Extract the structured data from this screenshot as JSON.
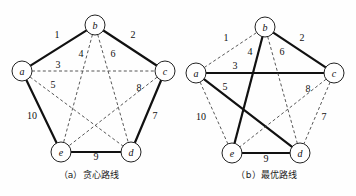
{
  "figure": {
    "panels": [
      {
        "id": "a",
        "caption": "（a）贪心路线",
        "nodes": [
          {
            "id": "a",
            "label": "a",
            "x": 22,
            "y": 71
          },
          {
            "id": "b",
            "label": "b",
            "x": 95,
            "y": 25
          },
          {
            "id": "c",
            "label": "c",
            "x": 165,
            "y": 71
          },
          {
            "id": "d",
            "label": "d",
            "x": 131,
            "y": 152
          },
          {
            "id": "e",
            "label": "e",
            "x": 61,
            "y": 152
          }
        ],
        "edges": [
          {
            "from": "a",
            "to": "b",
            "weight": "1",
            "style": "solid",
            "lx": 57,
            "ly": 38
          },
          {
            "from": "b",
            "to": "c",
            "weight": "2",
            "style": "solid",
            "lx": 133,
            "ly": 38
          },
          {
            "from": "a",
            "to": "c",
            "weight": "3",
            "style": "dashed",
            "lx": 58,
            "ly": 68
          },
          {
            "from": "b",
            "to": "e",
            "weight": "4",
            "style": "dashed",
            "lx": 81,
            "ly": 57
          },
          {
            "from": "a",
            "to": "d",
            "weight": "5",
            "style": "dashed",
            "lx": 53,
            "ly": 88
          },
          {
            "from": "b",
            "to": "d",
            "weight": "6",
            "style": "dashed",
            "lx": 113,
            "ly": 57
          },
          {
            "from": "c",
            "to": "d",
            "weight": "7",
            "style": "solid",
            "lx": 155,
            "ly": 119
          },
          {
            "from": "c",
            "to": "e",
            "weight": "8",
            "style": "dashed",
            "lx": 139,
            "ly": 91
          },
          {
            "from": "e",
            "to": "d",
            "weight": "9",
            "style": "solid",
            "lx": 96,
            "ly": 160
          },
          {
            "from": "a",
            "to": "e",
            "weight": "10",
            "style": "solid",
            "lx": 32,
            "ly": 119
          }
        ]
      },
      {
        "id": "b",
        "caption": "（b）最优路线",
        "nodes": [
          {
            "id": "a",
            "label": "a",
            "x": 18,
            "y": 73
          },
          {
            "id": "b",
            "label": "b",
            "x": 87,
            "y": 27
          },
          {
            "id": "c",
            "label": "c",
            "x": 156,
            "y": 73
          },
          {
            "id": "d",
            "label": "d",
            "x": 122,
            "y": 153
          },
          {
            "id": "e",
            "label": "e",
            "x": 54,
            "y": 153
          }
        ],
        "edges": [
          {
            "from": "a",
            "to": "b",
            "weight": "1",
            "style": "dashed",
            "lx": 48,
            "ly": 41
          },
          {
            "from": "b",
            "to": "c",
            "weight": "2",
            "style": "solid",
            "lx": 124,
            "ly": 41
          },
          {
            "from": "a",
            "to": "c",
            "weight": "3",
            "style": "solid",
            "lx": 57,
            "ly": 69
          },
          {
            "from": "b",
            "to": "e",
            "weight": "4",
            "style": "solid",
            "lx": 72,
            "ly": 55
          },
          {
            "from": "a",
            "to": "d",
            "weight": "5",
            "style": "solid",
            "lx": 47,
            "ly": 90
          },
          {
            "from": "b",
            "to": "d",
            "weight": "6",
            "style": "dashed",
            "lx": 104,
            "ly": 55
          },
          {
            "from": "c",
            "to": "d",
            "weight": "7",
            "style": "dashed",
            "lx": 146,
            "ly": 120
          },
          {
            "from": "c",
            "to": "e",
            "weight": "8",
            "style": "dashed",
            "lx": 130,
            "ly": 92
          },
          {
            "from": "e",
            "to": "d",
            "weight": "9",
            "style": "solid",
            "lx": 88,
            "ly": 162
          },
          {
            "from": "a",
            "to": "e",
            "weight": "10",
            "style": "dashed",
            "lx": 23,
            "ly": 120
          }
        ]
      }
    ],
    "node_radius": 10,
    "colors": {
      "solid_edge": "#111111",
      "dashed_edge": "#444444",
      "node_fill": "#ffffff",
      "node_stroke": "#222222",
      "text": "#111111",
      "background": "#fefefe"
    }
  }
}
